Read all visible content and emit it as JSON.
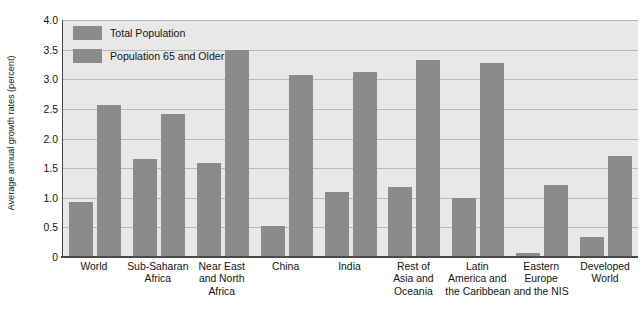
{
  "chart_data": {
    "type": "bar",
    "title": "",
    "xlabel": "",
    "ylabel": "Average annual growth rates (percent)",
    "ylim": [
      0,
      4.0
    ],
    "yticks": [
      "0",
      "0.5",
      "1.0",
      "1.5",
      "2.0",
      "2.5",
      "3.0",
      "3.5",
      "4.0"
    ],
    "ytick_values": [
      0,
      0.5,
      1.0,
      1.5,
      2.0,
      2.5,
      3.0,
      3.5,
      4.0
    ],
    "grid": true,
    "legend_position": "top-left",
    "categories": [
      "World",
      "Sub-Saharan Africa",
      "Near East and North Africa",
      "China",
      "India",
      "Rest of Asia and Oceania",
      "Latin America and the Caribbean",
      "Eastern Europe and the NIS",
      "Developed World"
    ],
    "category_lines": [
      [
        "World"
      ],
      [
        "Sub-Saharan",
        "Africa"
      ],
      [
        "Near East",
        "and North",
        "Africa"
      ],
      [
        "China"
      ],
      [
        "India"
      ],
      [
        "Rest of",
        "Asia and",
        "Oceania"
      ],
      [
        "Latin",
        "America and",
        "the Caribbean"
      ],
      [
        "Eastern",
        "Europe",
        "and the NIS"
      ],
      [
        "Developed",
        "World"
      ]
    ],
    "series": [
      {
        "name": "Total Population",
        "color": "#8b8b8b",
        "values": [
          0.93,
          1.65,
          1.58,
          0.52,
          1.1,
          1.19,
          1.0,
          0.06,
          0.33
        ]
      },
      {
        "name": "Population 65 and Older",
        "color": "#8b8b8b",
        "values": [
          2.56,
          2.42,
          3.5,
          3.07,
          3.13,
          3.32,
          3.28,
          1.22,
          1.71
        ]
      }
    ]
  },
  "legend": {
    "items": [
      {
        "label": "Total Population"
      },
      {
        "label": "Population 65 and Older"
      }
    ]
  },
  "style": {
    "bar_color": "#8b8b8b",
    "plot_background": "#e8e8e8",
    "gridline_color": "#b9b9b9",
    "axis_color": "#4a4a4a",
    "text_color": "#141414"
  }
}
